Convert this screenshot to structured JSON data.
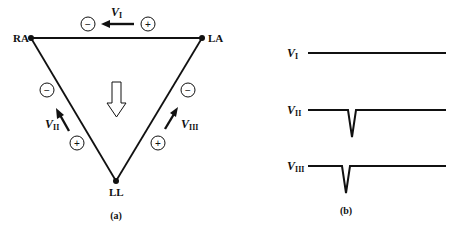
{
  "figure": {
    "panel_a": {
      "caption": "(a)",
      "nodes": [
        {
          "id": "RA",
          "label": "RA"
        },
        {
          "id": "LA",
          "label": "LA"
        },
        {
          "id": "LL",
          "label": "LL"
        }
      ],
      "leads": [
        {
          "name": "V",
          "sub": "I",
          "minus": "−",
          "plus": "+"
        },
        {
          "name": "V",
          "sub": "II",
          "minus": "−",
          "plus": "+"
        },
        {
          "name": "V",
          "sub": "III",
          "minus": "−",
          "plus": "+"
        }
      ]
    },
    "panel_b": {
      "caption": "(b)",
      "traces": [
        {
          "name": "V",
          "sub": "I",
          "shape": "flat"
        },
        {
          "name": "V",
          "sub": "II",
          "shape": "negative-spike"
        },
        {
          "name": "V",
          "sub": "III",
          "shape": "negative-spike"
        }
      ]
    }
  }
}
